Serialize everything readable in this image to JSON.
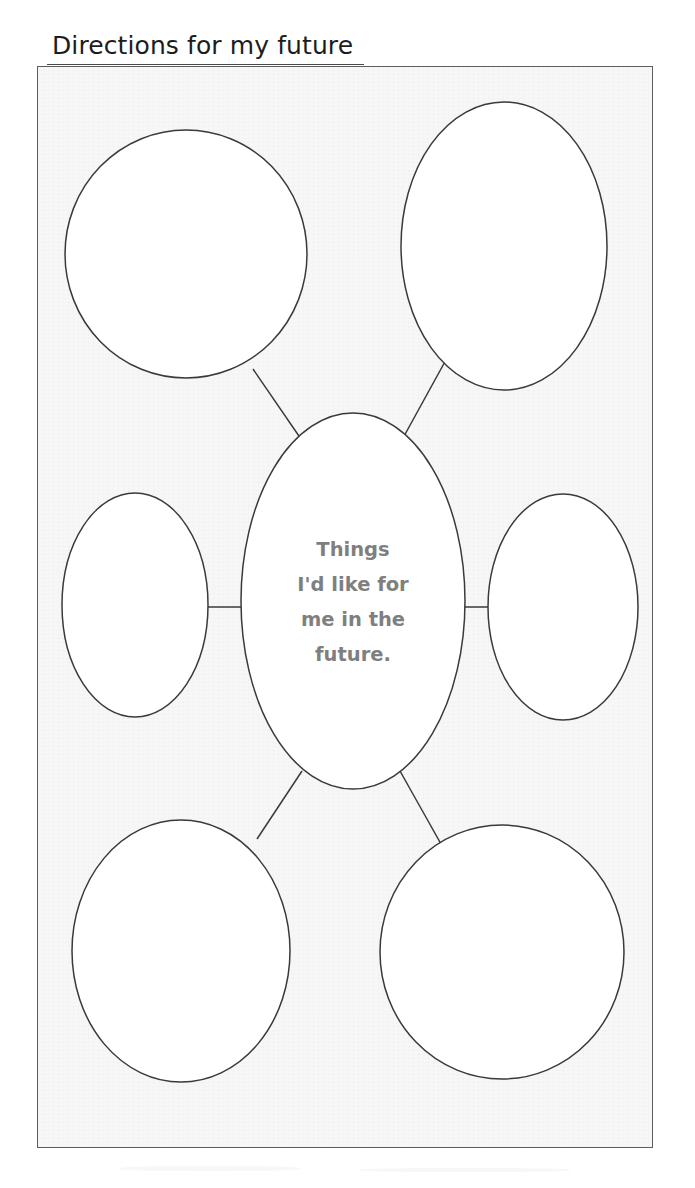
{
  "document": {
    "title": "Directions for my future",
    "type": "bubble-map-worksheet"
  },
  "colors": {
    "page_background": "#ffffff",
    "frame_background": "#f7f7f7",
    "frame_border": "#5d5d5d",
    "bubble_fill": "#ffffff",
    "bubble_stroke": "#3a3a3a",
    "connector_stroke": "#3a3a3a",
    "title_text": "#1d1d1d",
    "center_text": "#7f7f7f"
  },
  "frame": {
    "x": 37,
    "y": 66,
    "width": 616,
    "height": 1082
  },
  "center_bubble": {
    "name": "center-bubble",
    "cx": 353,
    "cy": 601,
    "rx": 112,
    "ry": 188,
    "text_lines": [
      "Things",
      "I'd like for",
      "me in the",
      "future."
    ],
    "full_text": "Things I'd like for me in the future."
  },
  "satellite_bubbles": [
    {
      "name": "bubble-top-left",
      "label": "",
      "cx": 186,
      "cy": 254,
      "rx": 121,
      "ry": 124
    },
    {
      "name": "bubble-top-right",
      "label": "",
      "cx": 504,
      "cy": 246,
      "rx": 103,
      "ry": 144
    },
    {
      "name": "bubble-middle-left",
      "label": "",
      "cx": 135,
      "cy": 605,
      "rx": 73,
      "ry": 112
    },
    {
      "name": "bubble-middle-right",
      "label": "",
      "cx": 563,
      "cy": 607,
      "rx": 75,
      "ry": 113
    },
    {
      "name": "bubble-bottom-left",
      "label": "",
      "cx": 181,
      "cy": 951,
      "rx": 109,
      "ry": 131
    },
    {
      "name": "bubble-bottom-right",
      "label": "",
      "cx": 502,
      "cy": 952,
      "rx": 122,
      "ry": 127
    }
  ],
  "connectors": [
    {
      "name": "connector-top-left",
      "x1": 253,
      "y1": 369,
      "x2": 301,
      "y2": 439
    },
    {
      "name": "connector-top-right",
      "x1": 447,
      "y1": 358,
      "x2": 403,
      "y2": 438
    },
    {
      "name": "connector-middle-left",
      "x1": 208,
      "y1": 607,
      "x2": 243,
      "y2": 607
    },
    {
      "name": "connector-middle-right",
      "x1": 463,
      "y1": 607,
      "x2": 490,
      "y2": 607
    },
    {
      "name": "connector-bottom-left",
      "x1": 302,
      "y1": 771,
      "x2": 257,
      "y2": 839
    },
    {
      "name": "connector-bottom-right",
      "x1": 400,
      "y1": 771,
      "x2": 441,
      "y2": 844
    }
  ]
}
